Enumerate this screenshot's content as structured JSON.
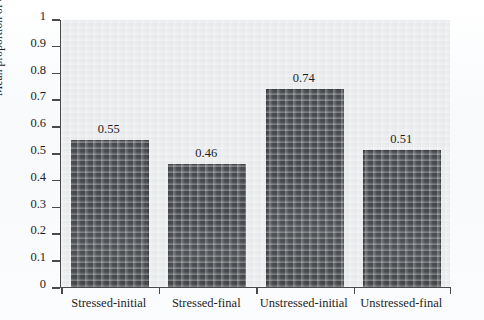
{
  "chart_data": {
    "type": "bar",
    "title": "",
    "subtitle": "",
    "xlabel": "",
    "ylabel": "Mean proportion of errors",
    "categories": [
      "Stressed-initial",
      "Stressed-final",
      "Unstressed-initial",
      "Unstressed-final"
    ],
    "values": [
      0.55,
      0.46,
      0.74,
      0.51
    ],
    "data_labels": [
      "0.55",
      "0.46",
      "0.74",
      "0.51"
    ],
    "ylim": [
      0,
      1
    ],
    "ytick_labels": [
      "1",
      "0.9",
      "0.8",
      "0.7",
      "0.6",
      "0.5",
      "0.4",
      "0.3",
      "0.2",
      "0.1",
      "0"
    ],
    "ytick_values": [
      1,
      0.9,
      0.8,
      0.7,
      0.6,
      0.5,
      0.4,
      0.3,
      0.2,
      0.1,
      0
    ],
    "grid": false,
    "legend": null,
    "legend_position": "none",
    "series": [
      {
        "name": "Mean proportion of errors",
        "values": [
          0.55,
          0.46,
          0.74,
          0.51
        ],
        "color": "#494c50"
      }
    ],
    "colors": {
      "bar_fill": "#494c50",
      "bar_edge": "#3a3d40",
      "plot_background": "#e9ebed",
      "figure_background": "#fdfdfe",
      "axis": "#4a4a4a",
      "text": "#1d1d1f"
    }
  }
}
